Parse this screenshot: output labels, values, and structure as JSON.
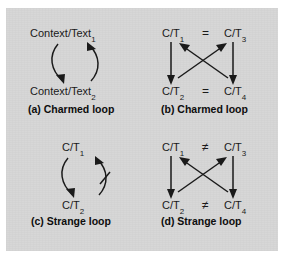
{
  "figure": {
    "background_color": "#d6d6d6",
    "page_color": "#ffffff",
    "ink_color": "#1a1a1a",
    "panels": [
      {
        "id": "a",
        "caption": "(a) Charmed loop",
        "top_label": "Context/Text",
        "top_sub": "1",
        "bottom_label": "Context/Text",
        "bottom_sub": "2",
        "loop_type": "charmed",
        "negated": false,
        "arrows": [
          "curve-down-left",
          "curve-up-right"
        ]
      },
      {
        "id": "b",
        "caption": "(b) Charmed loop",
        "nodes": [
          {
            "text": "C/T",
            "sub": "1",
            "position": "top-left"
          },
          {
            "text": "C/T",
            "sub": "3",
            "position": "top-right"
          },
          {
            "text": "C/T",
            "sub": "2",
            "position": "bottom-left"
          },
          {
            "text": "C/T",
            "sub": "4",
            "position": "bottom-right"
          }
        ],
        "relations": [
          {
            "symbol": "=",
            "between": "top-left/top-right"
          },
          {
            "symbol": "=",
            "between": "bottom-left/bottom-right"
          }
        ],
        "arrows": [
          "down-left-vertical",
          "down-right-vertical",
          "diagonal-up-left",
          "diagonal-up-right"
        ]
      },
      {
        "id": "c",
        "caption": "(c) Strange loop",
        "top_label": "C/T",
        "top_sub": "1",
        "bottom_label": "C/T",
        "bottom_sub": "2",
        "loop_type": "strange",
        "negated": true,
        "arrows": [
          "curve-down-left",
          "curve-up-right-struck"
        ]
      },
      {
        "id": "d",
        "caption": "(d) Strange loop",
        "nodes": [
          {
            "text": "C/T",
            "sub": "1",
            "position": "top-left"
          },
          {
            "text": "C/T",
            "sub": "3",
            "position": "top-right"
          },
          {
            "text": "C/T",
            "sub": "2",
            "position": "bottom-left"
          },
          {
            "text": "C/T",
            "sub": "4",
            "position": "bottom-right"
          }
        ],
        "relations": [
          {
            "symbol": "≠",
            "between": "top-left/top-right"
          },
          {
            "symbol": "≠",
            "between": "bottom-left/bottom-right"
          }
        ],
        "arrows": [
          "down-left-vertical",
          "down-right-vertical",
          "diagonal-up-left",
          "diagonal-up-right"
        ]
      }
    ]
  }
}
